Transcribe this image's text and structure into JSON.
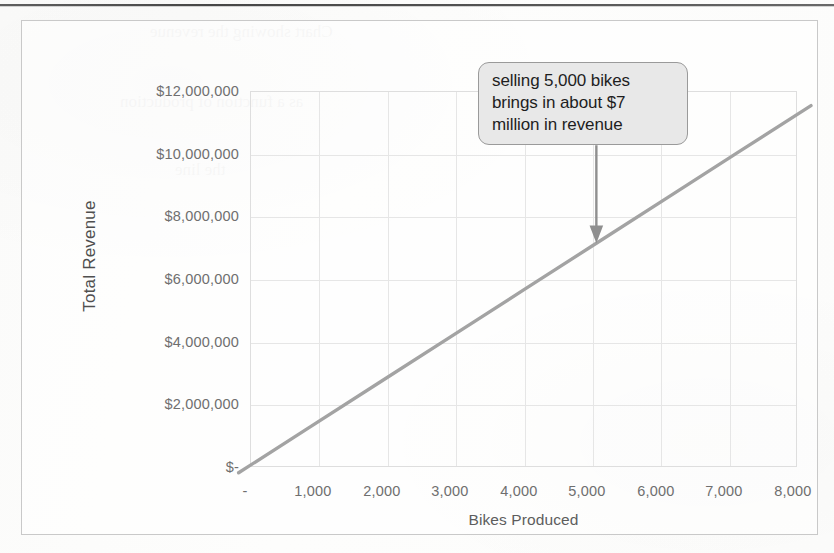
{
  "chart_data": {
    "type": "line",
    "title": "",
    "xlabel": "Bikes Produced",
    "ylabel": "Total Revenue",
    "xlim": [
      0,
      8000
    ],
    "ylim": [
      0,
      12000000
    ],
    "grid": true,
    "legend": "none",
    "x": [
      0,
      1000,
      2000,
      3000,
      4000,
      5000,
      6000,
      7000,
      8000
    ],
    "values": [
      0,
      1400000,
      2800000,
      4200000,
      5600000,
      7000000,
      8400000,
      9800000,
      11200000
    ],
    "series": [
      {
        "name": "Total Revenue",
        "color": "#a3a3a3",
        "values": [
          0,
          1400000,
          2800000,
          4200000,
          5600000,
          7000000,
          8400000,
          9800000,
          11200000
        ]
      }
    ],
    "x_tick_labels": [
      "-",
      "1,000",
      "2,000",
      "3,000",
      "4,000",
      "5,000",
      "6,000",
      "7,000",
      "8,000"
    ],
    "y_tick_labels": [
      "$-",
      "$2,000,000",
      "$4,000,000",
      "$6,000,000",
      "$8,000,000",
      "$10,000,000",
      "$12,000,000"
    ],
    "y_tick_values": [
      0,
      2000000,
      4000000,
      6000000,
      8000000,
      10000000,
      12000000
    ],
    "annotations": [
      {
        "text": "selling 5,000 bikes brings in about $7 million in revenue",
        "lines": [
          "selling 5,000 bikes",
          "brings in about $7",
          "million in revenue"
        ],
        "points_to_x": 5000,
        "points_to_y": 7000000,
        "arrow_color": "#8f8f8f",
        "box_fill": "#e8e8e8",
        "box_border": "#9a9a9a"
      }
    ]
  },
  "annotation": {
    "line1": "selling 5,000 bikes",
    "line2": "brings in about $7",
    "line3": "million in revenue"
  },
  "colors": {
    "series_line": "#a3a3a3",
    "gridline": "#e6e6e6",
    "plot_border": "#dedede",
    "frame_border": "#c9c9c9",
    "tick_text": "#6f6f6f",
    "page_background": "#fdfdfc"
  },
  "ghost_text": {
    "g1": "Chart showing the revenue",
    "g2": "as a function of production",
    "g3": "the line"
  }
}
